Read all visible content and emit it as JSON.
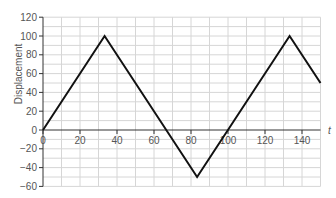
{
  "chart_data": {
    "type": "line",
    "title": "",
    "xlabel": "t",
    "ylabel": "Displacement",
    "xlim": [
      0,
      150
    ],
    "ylim": [
      -60,
      120
    ],
    "x_ticks": [
      0,
      20,
      40,
      60,
      80,
      100,
      120,
      140
    ],
    "y_ticks": [
      -60,
      -40,
      -20,
      0,
      20,
      40,
      60,
      80,
      100,
      120
    ],
    "grid": true,
    "grid_minor_step_x": 10,
    "grid_minor_step_y": 10,
    "legend": null,
    "series": [
      {
        "name": "displacement",
        "color": "#111111",
        "points": [
          [
            0,
            0
          ],
          [
            33.3,
            100
          ],
          [
            83.3,
            -50
          ],
          [
            133.3,
            100
          ],
          [
            150,
            50
          ]
        ]
      }
    ]
  }
}
